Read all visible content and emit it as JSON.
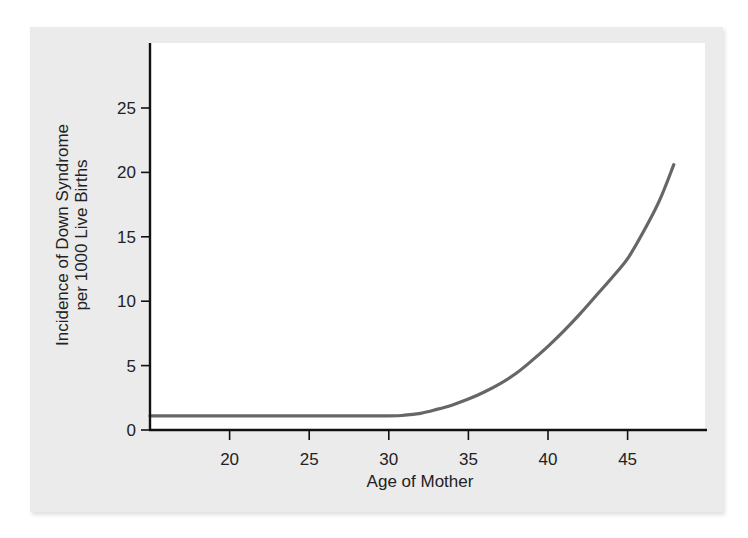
{
  "chart_data": {
    "type": "line",
    "title": "",
    "xlabel": "Age of Mother",
    "ylabel_lines": [
      "Incidence of Down Syndrome",
      "per 1000 Live Births"
    ],
    "ylabel": "Incidence of Down Syndrome per 1000 Live Births",
    "xlim": [
      15,
      50
    ],
    "ylim": [
      0,
      30
    ],
    "x_ticks": [
      20,
      25,
      30,
      35,
      40,
      45
    ],
    "y_ticks": [
      0,
      5,
      10,
      15,
      20,
      25
    ],
    "grid": false,
    "legend": null,
    "series": [
      {
        "name": "Incidence of Down Syndrome",
        "color": "#666666",
        "x": [
          15,
          20,
          25,
          30,
          31,
          32,
          33,
          34,
          35,
          36,
          37,
          38,
          39,
          40,
          41,
          42,
          43,
          44,
          45,
          46,
          47,
          47.9
        ],
        "values": [
          1.1,
          1.1,
          1.1,
          1.1,
          1.15,
          1.3,
          1.6,
          1.95,
          2.4,
          2.95,
          3.6,
          4.4,
          5.4,
          6.5,
          7.7,
          9.0,
          10.4,
          11.8,
          13.3,
          15.4,
          17.8,
          20.6
        ]
      }
    ]
  },
  "colors": {
    "panel_background": "#ebebeb",
    "plot_background": "#ffffff",
    "axis": "#111111",
    "line": "#666666",
    "text": "#222222"
  }
}
